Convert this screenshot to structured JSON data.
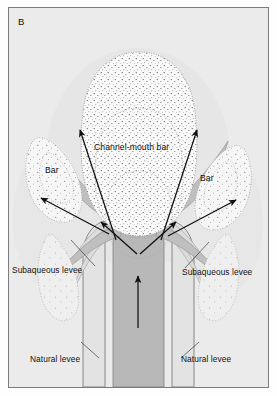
{
  "figure": {
    "panel_label": "B",
    "domain": "sedimentary-geology-diagram"
  },
  "colors": {
    "background": "#ebebeb",
    "frame_border": "#7a7d80",
    "channel_fill": "#b9b9b9",
    "levee_fill": "#d8d8d8",
    "bar_fill": "#f7f7f7",
    "stipple": "#4a4a4a",
    "contour": "#9a9a9a",
    "arrow": "#111111",
    "leader": "#444444",
    "text": "#111111"
  },
  "labels": [
    {
      "id": "channel-mouth-bar",
      "text": "Channel-mouth bar",
      "x": 93,
      "y": 141,
      "size": "big"
    },
    {
      "id": "bar-left",
      "text": "Bar",
      "x": 44,
      "y": 164,
      "size": "big"
    },
    {
      "id": "bar-right",
      "text": "Bar",
      "x": 199,
      "y": 172,
      "size": "big"
    },
    {
      "id": "subaqueous-levee-left",
      "text": "Subaqueous levee",
      "x": 11,
      "y": 264,
      "size": "std"
    },
    {
      "id": "subaqueous-levee-right",
      "text": "Subaqueous levee",
      "x": 181,
      "y": 266,
      "size": "std"
    },
    {
      "id": "natural-levee-left",
      "text": "Natural levee",
      "x": 29,
      "y": 353,
      "size": "std"
    },
    {
      "id": "natural-levee-right",
      "text": "Natural levee",
      "x": 180,
      "y": 353,
      "size": "std"
    }
  ],
  "features": {
    "channel_mouth_bar": "large central lobate stippled bar with three nested arcuate contours",
    "flanking_bars": [
      "left lateral bar",
      "right lateral bar"
    ],
    "levees": [
      "left natural levee",
      "right natural levee",
      "left subaqueous levee",
      "right subaqueous levee"
    ],
    "flow_arrows": 7,
    "arrow_meaning": "sediment-laden flow direction"
  }
}
